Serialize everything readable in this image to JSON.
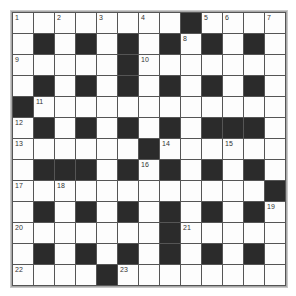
{
  "puzzle": {
    "rows": 13,
    "cols": 13,
    "grid": [
      "........#....",
      ".#.#.#.#.#.#.",
      ".....#.......",
      ".#.#.#.#.#.#.",
      "#............",
      ".#.#.#.#.###.",
      "......#......",
      ".###.#.#.#.#.",
      "............#",
      ".#.#.#.#.#.#.",
      ".......#.....",
      ".#.#.#.#.#.#.",
      "....#........"
    ],
    "numbers": [
      {
        "r": 0,
        "c": 0,
        "n": "1"
      },
      {
        "r": 0,
        "c": 2,
        "n": "2"
      },
      {
        "r": 0,
        "c": 4,
        "n": "3"
      },
      {
        "r": 0,
        "c": 6,
        "n": "4"
      },
      {
        "r": 0,
        "c": 9,
        "n": "5"
      },
      {
        "r": 0,
        "c": 10,
        "n": "6"
      },
      {
        "r": 0,
        "c": 12,
        "n": "7"
      },
      {
        "r": 1,
        "c": 8,
        "n": "8"
      },
      {
        "r": 2,
        "c": 0,
        "n": "9"
      },
      {
        "r": 2,
        "c": 6,
        "n": "10"
      },
      {
        "r": 4,
        "c": 1,
        "n": "11"
      },
      {
        "r": 5,
        "c": 0,
        "n": "12"
      },
      {
        "r": 6,
        "c": 0,
        "n": "13"
      },
      {
        "r": 6,
        "c": 7,
        "n": "14"
      },
      {
        "r": 6,
        "c": 10,
        "n": "15"
      },
      {
        "r": 7,
        "c": 6,
        "n": "16"
      },
      {
        "r": 8,
        "c": 0,
        "n": "17"
      },
      {
        "r": 8,
        "c": 2,
        "n": "18"
      },
      {
        "r": 9,
        "c": 12,
        "n": "19"
      },
      {
        "r": 10,
        "c": 0,
        "n": "20"
      },
      {
        "r": 10,
        "c": 8,
        "n": "21"
      },
      {
        "r": 12,
        "c": 0,
        "n": "22"
      },
      {
        "r": 12,
        "c": 5,
        "n": "23"
      }
    ]
  },
  "colors": {
    "black_cell": "#2b2b2b",
    "white_cell": "#fdfdfd",
    "grid_line": "#555555"
  }
}
